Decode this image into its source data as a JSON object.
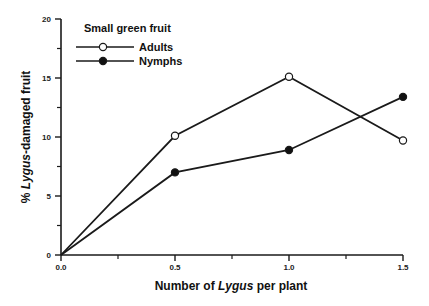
{
  "chart_data": {
    "type": "line",
    "title": "",
    "xlabel_parts": [
      "Number of ",
      "Lygus",
      " per plant"
    ],
    "ylabel_parts": [
      "% ",
      "Lygus",
      "-damaged fruit"
    ],
    "xlim": [
      0,
      1.5
    ],
    "ylim": [
      0,
      20
    ],
    "x_ticks": [
      0.0,
      0.5,
      1.0,
      1.5
    ],
    "x_tick_labels": [
      "0.0",
      "0.5",
      "1.0",
      "1.5"
    ],
    "x_minor_ticks": [
      0.25,
      0.75,
      1.25
    ],
    "y_ticks": [
      0,
      5,
      10,
      15,
      20
    ],
    "y_tick_labels": [
      "0",
      "5",
      "10",
      "15",
      "20"
    ],
    "y_minor_ticks": [
      2.5,
      7.5,
      12.5,
      17.5
    ],
    "grid": false,
    "legend": {
      "title": "Small green fruit",
      "position": "top-left"
    },
    "x": [
      0.0,
      0.5,
      1.0,
      1.5
    ],
    "series": [
      {
        "name": "Adults",
        "marker": "open-circle",
        "values": [
          0,
          10.1,
          15.1,
          9.7
        ]
      },
      {
        "name": "Nymphs",
        "marker": "filled-circle",
        "values": [
          0,
          7.0,
          8.9,
          13.4
        ]
      }
    ]
  }
}
